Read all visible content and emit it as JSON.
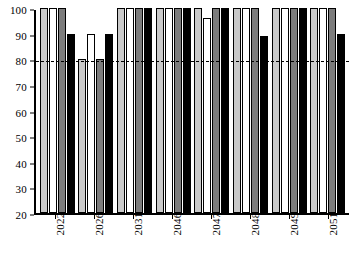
{
  "chart_data": {
    "type": "bar",
    "title": "",
    "subtitle": "",
    "xlabel": "",
    "ylabel": "",
    "categories": [
      "2022",
      "2026",
      "2031",
      "2046",
      "2047",
      "2048",
      "2049",
      "2051"
    ],
    "series": [
      {
        "name": "series-1",
        "color": "#c9c9c9",
        "values": [
          100,
          80,
          100,
          100,
          100,
          100,
          100,
          100
        ]
      },
      {
        "name": "series-2",
        "color": "#ffffff",
        "values": [
          100,
          90,
          100,
          100,
          96,
          100,
          100,
          100
        ]
      },
      {
        "name": "series-3",
        "color": "#7c7c7c",
        "values": [
          100,
          80,
          100,
          100,
          100,
          100,
          100,
          100
        ]
      },
      {
        "name": "series-4",
        "color": "#000000",
        "values": [
          90,
          90,
          100,
          100,
          100,
          89,
          100,
          90
        ]
      }
    ],
    "ylim": [
      20,
      100
    ],
    "yticks": [
      20,
      30,
      40,
      50,
      60,
      70,
      80,
      90,
      100
    ],
    "ytick_labels": [
      "20",
      "30",
      "40",
      "50",
      "60",
      "70",
      "80",
      "90",
      "100"
    ],
    "grid": false,
    "legend": "none",
    "annotations": [
      {
        "name": "threshold-line",
        "type": "hline",
        "value": 80,
        "style": "dashed",
        "color": "#000000"
      }
    ],
    "axis_color": "#000000",
    "background": "#ffffff"
  }
}
